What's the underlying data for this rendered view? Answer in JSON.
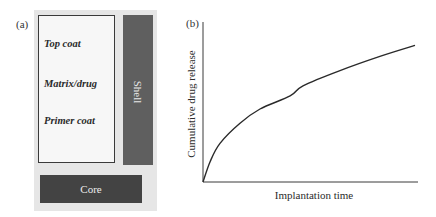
{
  "panel_a": {
    "label": "(a)",
    "layers": [
      {
        "label": "Top coat"
      },
      {
        "label": "Matrix/drug"
      },
      {
        "label": "Primer coat"
      }
    ],
    "shell_label": "Shell",
    "core_label": "Core",
    "colors": {
      "background": "#e6e6e6",
      "coating_box": "#f7f7f7",
      "shell": "#5f5f5f",
      "core": "#434343"
    }
  },
  "panel_b": {
    "label": "(b)",
    "xlabel": "Implantation time",
    "ylabel": "Cumulative drug release"
  },
  "chart_data": {
    "type": "line",
    "title": "",
    "xlabel": "Implantation time",
    "ylabel": "Cumulative drug release",
    "grid": false,
    "legend": null,
    "ticks": "none (qualitative axes)",
    "xlim": [
      0,
      1
    ],
    "ylim": [
      0,
      1
    ],
    "series": [
      {
        "name": "Cumulative drug release",
        "x": [
          0,
          0.033,
          0.079,
          0.172,
          0.265,
          0.405,
          0.465,
          0.637,
          0.823,
          0.986
        ],
        "y": [
          0,
          0.127,
          0.241,
          0.367,
          0.456,
          0.538,
          0.601,
          0.696,
          0.785,
          0.854
        ]
      }
    ],
    "shape": "concave, monotonically increasing (square-root-like release profile)"
  }
}
